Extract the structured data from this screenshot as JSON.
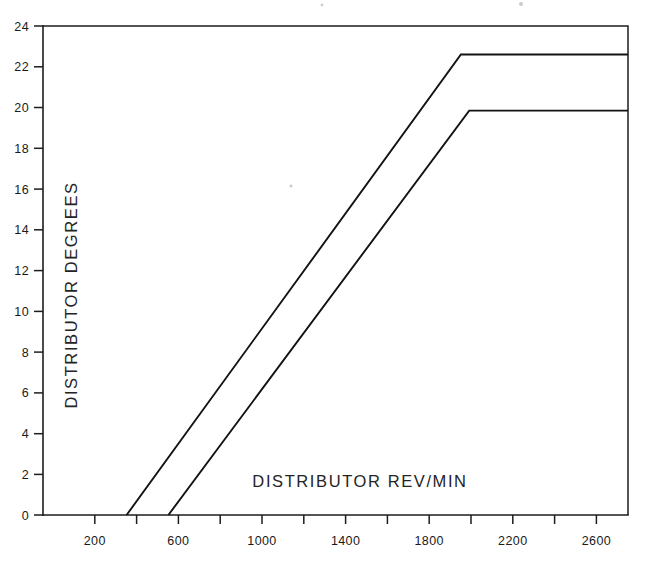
{
  "chart_data": {
    "type": "line",
    "title": "",
    "subtitle": "",
    "xlabel": "DISTRIBUTOR   REV/MIN",
    "ylabel": "DISTRIBUTOR   DEGREES",
    "xlim": [
      0,
      2800
    ],
    "ylim": [
      0,
      24
    ],
    "grid": false,
    "legend_position": "none",
    "x_major_ticks": [
      200,
      600,
      1000,
      1400,
      1800,
      2200,
      2600
    ],
    "x_minor_ticks": [
      400,
      800,
      1200,
      1600,
      2000,
      2400,
      2800
    ],
    "x_tick_labels": [
      "200",
      "600",
      "1000",
      "1400",
      "1800",
      "2200",
      "2600"
    ],
    "y_ticks": [
      0,
      2,
      4,
      6,
      8,
      10,
      12,
      14,
      16,
      18,
      20,
      22,
      24
    ],
    "y_tick_labels": [
      "0",
      "2",
      "4",
      "6",
      "8",
      "10",
      "12",
      "14",
      "16",
      "18",
      "20",
      "22",
      "24"
    ],
    "series": [
      {
        "name": "Maximum advance limit",
        "points": [
          [
            400,
            0
          ],
          [
            2000,
            22.6
          ],
          [
            2800,
            22.6
          ]
        ]
      },
      {
        "name": "Minimum advance limit",
        "points": [
          [
            600,
            0
          ],
          [
            2040,
            19.85
          ],
          [
            2800,
            19.85
          ]
        ]
      }
    ]
  },
  "axes": {
    "x_title": "DISTRIBUTOR   REV/MIN",
    "y_title": "DISTRIBUTOR   DEGREES",
    "x_labels": [
      "200",
      "600",
      "1000",
      "1400",
      "1800",
      "2200",
      "2600"
    ],
    "y_labels": [
      "24",
      "22",
      "20",
      "18",
      "16",
      "14",
      "12",
      "10",
      "8",
      "6",
      "4",
      "2",
      "0"
    ]
  },
  "colors": {
    "ink": "#1a1a1a",
    "line": "#121212",
    "background": "#ffffff"
  }
}
